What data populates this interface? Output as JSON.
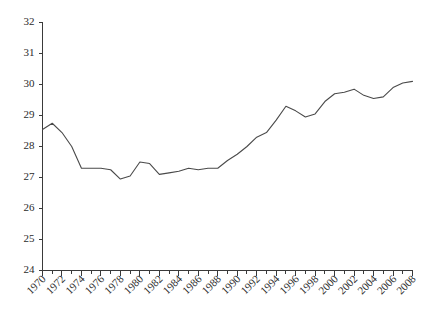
{
  "chart_data": {
    "type": "line",
    "title": "",
    "subtitle": "",
    "xlabel": "",
    "ylabel": "",
    "xlim": [
      1970,
      2008
    ],
    "ylim": [
      24,
      32
    ],
    "grid": false,
    "legend": null,
    "legend_position": "none",
    "line_color": "#4a4a4a",
    "axis_color": "#3a3a3a",
    "x_tick_labels": [
      "1970",
      "1972",
      "1974",
      "1976",
      "1978",
      "1980",
      "1982",
      "1984",
      "1986",
      "1988",
      "1990",
      "1992",
      "1994",
      "1996",
      "1998",
      "2000",
      "2002",
      "2004",
      "2006",
      "2008"
    ],
    "x_tick_values": [
      1970,
      1972,
      1974,
      1976,
      1978,
      1980,
      1982,
      1984,
      1986,
      1988,
      1990,
      1992,
      1994,
      1996,
      1998,
      2000,
      2002,
      2004,
      2006,
      2008
    ],
    "x_minor_tick_values": [
      1971,
      1973,
      1975,
      1977,
      1979,
      1981,
      1983,
      1985,
      1987,
      1989,
      1991,
      1993,
      1995,
      1997,
      1999,
      2001,
      2003,
      2005,
      2007
    ],
    "y_tick_labels": [
      "24",
      "25",
      "26",
      "27",
      "28",
      "29",
      "30",
      "31",
      "32"
    ],
    "y_tick_values": [
      24,
      25,
      26,
      27,
      28,
      29,
      30,
      31,
      32
    ],
    "x": [
      1970,
      1971,
      1972,
      1973,
      1974,
      1975,
      1976,
      1977,
      1978,
      1979,
      1980,
      1981,
      1982,
      1983,
      1984,
      1985,
      1986,
      1987,
      1988,
      1989,
      1990,
      1991,
      1992,
      1993,
      1994,
      1995,
      1996,
      1997,
      1998,
      1999,
      2000,
      2001,
      2002,
      2003,
      2004,
      2005,
      2006,
      2007,
      2008
    ],
    "values": [
      28.55,
      28.75,
      28.45,
      28.0,
      27.3,
      27.3,
      27.3,
      27.25,
      26.95,
      27.05,
      27.5,
      27.45,
      27.1,
      27.15,
      27.2,
      27.3,
      27.25,
      27.3,
      27.3,
      27.55,
      27.75,
      28.0,
      28.3,
      28.45,
      28.85,
      29.3,
      29.15,
      28.95,
      29.05,
      29.45,
      29.7,
      29.75,
      29.85,
      29.65,
      29.55,
      29.6,
      29.9,
      30.05,
      30.1
    ],
    "series": [
      {
        "name": "series-1",
        "values": [
          28.55,
          28.75,
          28.45,
          28.0,
          27.3,
          27.3,
          27.3,
          27.25,
          26.95,
          27.05,
          27.5,
          27.45,
          27.1,
          27.15,
          27.2,
          27.3,
          27.25,
          27.3,
          27.3,
          27.55,
          27.75,
          28.0,
          28.3,
          28.45,
          28.85,
          29.3,
          29.15,
          28.95,
          29.05,
          29.45,
          29.7,
          29.75,
          29.85,
          29.65,
          29.55,
          29.6,
          29.9,
          30.05,
          30.1
        ]
      }
    ]
  }
}
